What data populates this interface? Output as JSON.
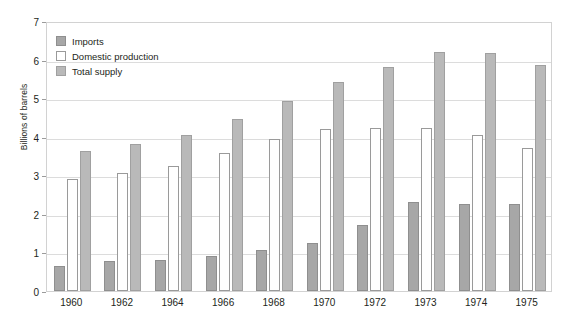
{
  "chart_data": {
    "type": "bar",
    "title": "",
    "subtitle": "",
    "xlabel": "",
    "ylabel": "Billions of barrels",
    "ylim": [
      0,
      7
    ],
    "ytick_step": 1,
    "yticks": [
      "0",
      "1",
      "2",
      "3",
      "4",
      "5",
      "6",
      "7"
    ],
    "grid": true,
    "legend_position": "top-left",
    "categories": [
      "1960",
      "1962",
      "1964",
      "1966",
      "1968",
      "1970",
      "1972",
      "1973",
      "1974",
      "1975"
    ],
    "series": [
      {
        "name": "Imports",
        "color": "#a7a7a7",
        "values": [
          0.65,
          0.78,
          0.8,
          0.9,
          1.07,
          1.25,
          1.72,
          2.3,
          2.25,
          2.25
        ]
      },
      {
        "name": "Domestic production",
        "color": "#ffffff",
        "values": [
          2.9,
          3.05,
          3.25,
          3.57,
          3.93,
          4.2,
          4.22,
          4.23,
          4.05,
          3.7
        ]
      },
      {
        "name": "Total supply",
        "color": "#b9b9b9",
        "values": [
          3.63,
          3.8,
          4.05,
          4.45,
          4.92,
          5.43,
          5.82,
          6.2,
          6.17,
          5.87
        ]
      }
    ]
  },
  "legend": {
    "items": [
      {
        "label": "Imports"
      },
      {
        "label": "Domestic production"
      },
      {
        "label": "Total supply"
      }
    ]
  }
}
